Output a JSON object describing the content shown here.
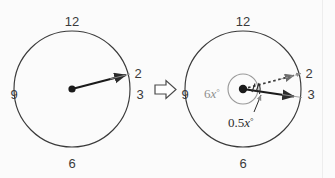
{
  "figure": {
    "background_color": "#fbfbfb",
    "stroke_color": "#3a3a3a",
    "gray_color": "#8e8e8e",
    "width": 335,
    "height": 178
  },
  "left_clock": {
    "name": "original-clock",
    "center": {
      "x": 72,
      "y": 89
    },
    "radius": 58,
    "numbers": [
      {
        "label": "12",
        "position": "top",
        "x": 72,
        "y": 21
      },
      {
        "label": "3",
        "position": "right",
        "x": 140,
        "y": 94
      },
      {
        "label": "6",
        "position": "bottom",
        "x": 72,
        "y": 163
      },
      {
        "label": "9",
        "position": "left",
        "x": 12,
        "y": 94
      },
      {
        "label": "2",
        "position": "upper-right",
        "x": 134,
        "y": 74
      }
    ],
    "hand": {
      "name": "hour-hand",
      "style": "solid-arrow",
      "tip_x": 128,
      "tip_y": 74
    }
  },
  "implication_arrow": {
    "name": "implies-arrow",
    "glyph": "rightwards-hollow-arrow",
    "x": 157,
    "y": 80
  },
  "right_clock": {
    "name": "result-clock",
    "center": {
      "x": 243,
      "y": 89
    },
    "radius": 58,
    "inner_radius": 15,
    "numbers": [
      {
        "label": "12",
        "position": "top",
        "x": 243,
        "y": 21
      },
      {
        "label": "3",
        "position": "right",
        "x": 311,
        "y": 94
      },
      {
        "label": "6",
        "position": "bottom",
        "x": 243,
        "y": 163
      },
      {
        "label": "9",
        "position": "left",
        "x": 183,
        "y": 94
      },
      {
        "label": "2",
        "position": "upper-right",
        "x": 305,
        "y": 74
      }
    ],
    "hands": [
      {
        "name": "dotted-hand",
        "style": "dotted-arrow",
        "tip_x": 298,
        "tip_y": 74
      },
      {
        "name": "solid-hand",
        "style": "solid-arrow",
        "tip_x": 299,
        "tip_y": 97
      }
    ],
    "angle_labels": [
      {
        "name": "outer-angle-label",
        "text_number": "6",
        "text_variable": "x",
        "text_degree": "°",
        "full": "6x°",
        "color": "#8e8e8e",
        "x": 207,
        "y": 94
      },
      {
        "name": "inner-angle-label",
        "text_number": "0.5",
        "text_variable": "x",
        "text_degree": "°",
        "full": "0.5x°",
        "color": "#2b2b2b",
        "x": 229,
        "y": 123
      }
    ]
  }
}
